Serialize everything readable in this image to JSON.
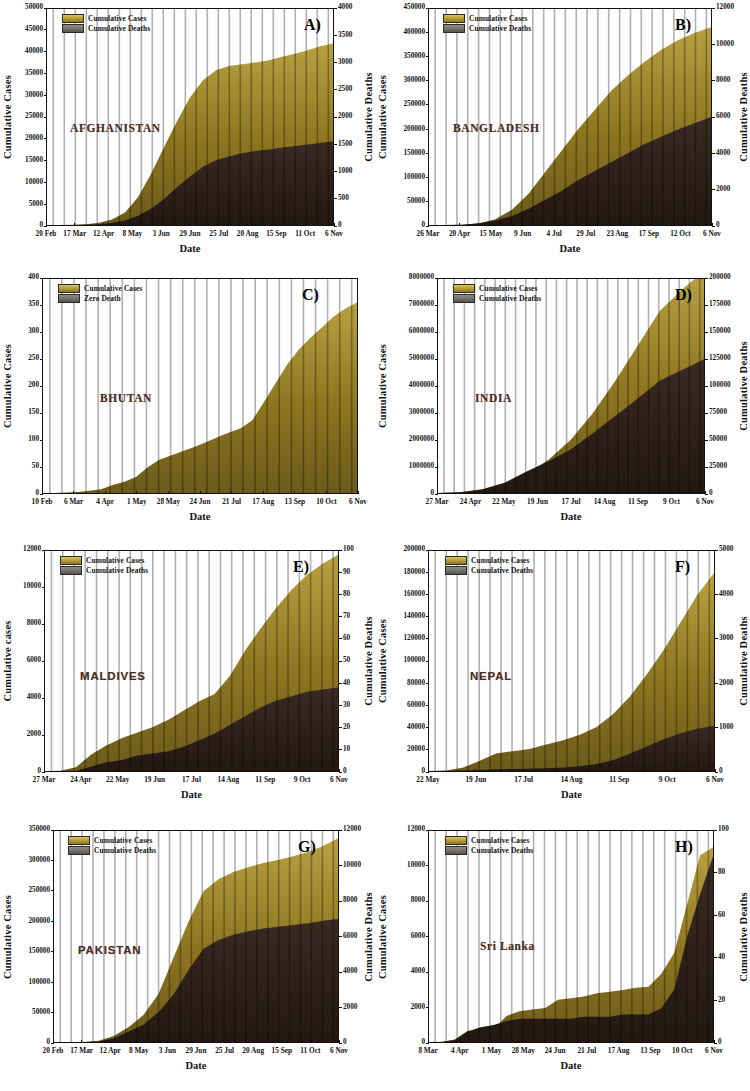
{
  "figure": {
    "xlabel": "Date",
    "legend_cases": "Cumulative Cases",
    "legend_deaths": "Cumulative Deaths",
    "legend_zero_death": "Zero Death",
    "colors": {
      "cases": "#8d7520",
      "cases_light": "#c9b44c",
      "deaths": "#3a2a22",
      "deaths_swatch": "#75726f",
      "axis": "#111111",
      "country_text": "#4a2c23",
      "background": "#ffffff"
    }
  },
  "chart_data": [
    {
      "panel": "A)",
      "type": "area",
      "country": "AFGHANISTAN",
      "title": "AFGHANISTAN",
      "xlabel": "Date",
      "ylabel": "Cumulative Cases",
      "y2label": "Cumulative Deaths",
      "ylim": [
        0,
        50000
      ],
      "y2lim": [
        0,
        4000
      ],
      "yticks": [
        "0",
        "5000",
        "10000",
        "15000",
        "20000",
        "25000",
        "30000",
        "35000",
        "40000",
        "45000",
        "50000"
      ],
      "y2ticks": [
        "0",
        "500",
        "1000",
        "1500",
        "2000",
        "2500",
        "3000",
        "3500",
        "4000"
      ],
      "xticks": [
        "20 Feb",
        "17 Mar",
        "12 Apr",
        "8 May",
        "3 Jun",
        "29 Jun",
        "25 Jul",
        "20 Aug",
        "15 Sep",
        "11 Oct",
        "6 Nov"
      ],
      "legend": [
        "Cumulative Cases",
        "Cumulative Deaths"
      ],
      "series": [
        {
          "name": "Cumulative Cases",
          "values": [
            0,
            5,
            40,
            170,
            500,
            1280,
            2900,
            6400,
            11800,
            18000,
            24000,
            29500,
            33500,
            35800,
            36800,
            37200,
            37600,
            38100,
            38900,
            39600,
            40400,
            41400,
            42000
          ]
        },
        {
          "name": "Cumulative Deaths",
          "values": [
            0,
            0,
            1,
            4,
            15,
            40,
            85,
            170,
            300,
            480,
            700,
            900,
            1080,
            1200,
            1270,
            1330,
            1370,
            1400,
            1430,
            1460,
            1490,
            1520,
            1550
          ]
        }
      ],
      "x": [
        "20 Feb",
        "27 Feb",
        "5 Mar",
        "17 Mar",
        "29 Mar",
        "8 Apr",
        "20 Apr",
        "1 May",
        "8 May",
        "20 May",
        "3 Jun",
        "16 Jun",
        "29 Jun",
        "10 Jul",
        "25 Jul",
        "5 Aug",
        "20 Aug",
        "1 Sep",
        "15 Sep",
        "28 Sep",
        "11 Oct",
        "24 Oct",
        "6 Nov"
      ]
    },
    {
      "panel": "B)",
      "type": "area",
      "country": "BANGLADESH",
      "title": "BANGLADESH",
      "xlabel": "Date",
      "ylabel": "Cumulative Cases",
      "y2label": "Cumulative Deaths",
      "ylim": [
        0,
        450000
      ],
      "y2lim": [
        0,
        12000
      ],
      "yticks": [
        "0",
        "50000",
        "100000",
        "150000",
        "200000",
        "250000",
        "300000",
        "350000",
        "400000",
        "450000"
      ],
      "y2ticks": [
        "0",
        "2000",
        "4000",
        "6000",
        "8000",
        "10000",
        "12000"
      ],
      "xticks": [
        "26 Mar",
        "20 Apr",
        "15 May",
        "9 Jun",
        "4 Jul",
        "29 Jul",
        "23 Aug",
        "17 Sep",
        "12 Oct",
        "6 Nov"
      ],
      "legend": [
        "Cumulative Cases",
        "Cumulative Deaths"
      ],
      "series": [
        {
          "name": "Cumulative Cases",
          "values": [
            0,
            50,
            500,
            3000,
            12000,
            32000,
            65000,
            110000,
            155000,
            200000,
            240000,
            280000,
            312000,
            340000,
            365000,
            385000,
            400000,
            412000
          ]
        },
        {
          "name": "Cumulative Deaths",
          "values": [
            0,
            2,
            20,
            100,
            250,
            500,
            900,
            1400,
            1900,
            2500,
            3000,
            3500,
            4000,
            4500,
            4900,
            5300,
            5650,
            6000
          ]
        }
      ],
      "x": [
        "26 Mar",
        "8 Apr",
        "20 Apr",
        "2 May",
        "15 May",
        "26 May",
        "9 Jun",
        "21 Jun",
        "4 Jul",
        "16 Jul",
        "29 Jul",
        "10 Aug",
        "23 Aug",
        "4 Sep",
        "17 Sep",
        "29 Sep",
        "12 Oct",
        "6 Nov"
      ]
    },
    {
      "panel": "C)",
      "type": "area",
      "country": "BHUTAN",
      "title": "BHUTAN",
      "xlabel": "Date",
      "ylabel": "Cumulative Cases",
      "y2label": null,
      "ylim": [
        0,
        400
      ],
      "yticks": [
        "0",
        "50",
        "100",
        "150",
        "200",
        "250",
        "300",
        "350",
        "400"
      ],
      "xticks": [
        "10 Feb",
        "6 Mar",
        "4 Apr",
        "1 May",
        "28 May",
        "24 Jun",
        "21 Jul",
        "17 Aug",
        "13 Sep",
        "10 Oct",
        "6 Nov"
      ],
      "legend": [
        "Cumulative Cases",
        "Zero Death"
      ],
      "series": [
        {
          "name": "Cumulative Cases",
          "values": [
            0,
            0,
            1,
            2,
            4,
            7,
            15,
            21,
            30,
            48,
            62,
            70,
            78,
            86,
            95,
            104,
            113,
            121,
            136,
            170,
            205,
            240,
            268,
            290,
            310,
            330,
            345,
            356
          ]
        }
      ],
      "x": [
        "10 Feb",
        "25 Feb",
        "6 Mar",
        "20 Mar",
        "4 Apr",
        "18 Apr",
        "1 May",
        "14 May",
        "28 May",
        "10 Jun",
        "24 Jun",
        "7 Jul",
        "21 Jul",
        "3 Aug",
        "17 Aug",
        "31 Aug",
        "13 Sep",
        "26 Sep",
        "10 Oct",
        "20 Oct",
        "6 Nov"
      ]
    },
    {
      "panel": "D)",
      "type": "area",
      "country": "INDIA",
      "title": "INDIA",
      "xlabel": "Date",
      "ylabel": "Cumulative Cases",
      "y2label": "Cumulative Deaths",
      "ylim": [
        0,
        8000000
      ],
      "y2lim": [
        0,
        200000
      ],
      "yticks": [
        "0",
        "1000000",
        "2000000",
        "3000000",
        "4000000",
        "5000000",
        "6000000",
        "7000000",
        "8000000"
      ],
      "y2ticks": [
        "0",
        "25000",
        "50000",
        "75000",
        "100000",
        "125000",
        "150000",
        "175000",
        "200000"
      ],
      "xticks": [
        "27 Mar",
        "24 Apr",
        "22 May",
        "19 Jun",
        "17 Jul",
        "14 Aug",
        "11 Sep",
        "9 Oct",
        "6 Nov"
      ],
      "legend": [
        "Cumulative Cases",
        "Cumulative Deaths"
      ],
      "series": [
        {
          "name": "Cumulative Cases",
          "values": [
            0,
            25000,
            120000,
            330000,
            700000,
            1250000,
            2000000,
            3000000,
            4200000,
            5500000,
            6800000,
            7600000,
            8300000
          ]
        },
        {
          "name": "Cumulative Deaths",
          "values": [
            0,
            800,
            3600,
            9500,
            20000,
            30000,
            41000,
            56000,
            72000,
            88000,
            105000,
            115000,
            125000
          ]
        }
      ],
      "x": [
        "27 Mar",
        "24 Apr",
        "22 May",
        "19 Jun",
        "10 Jul",
        "17 Jul",
        "5 Aug",
        "14 Aug",
        "1 Sep",
        "11 Sep",
        "25 Sep",
        "9 Oct",
        "6 Nov"
      ]
    },
    {
      "panel": "E)",
      "type": "area",
      "country": "MALDIVES",
      "title": "MALDIVES",
      "xlabel": "Date",
      "ylabel": "Cumulative cases",
      "y2label": "Cumulative Deaths",
      "ylim": [
        0,
        12000
      ],
      "y2lim": [
        0,
        100
      ],
      "yticks": [
        "0",
        "2000",
        "4000",
        "6000",
        "8000",
        "10000",
        "12000"
      ],
      "y2ticks": [
        "0",
        "10",
        "20",
        "30",
        "40",
        "50",
        "60",
        "70",
        "80",
        "90",
        "100"
      ],
      "xticks": [
        "27 Mar",
        "24 Apr",
        "22 May",
        "19 Jun",
        "17 Jul",
        "14 Aug",
        "11 Sep",
        "9 Oct",
        "6 Nov"
      ],
      "legend": [
        "Cumulative Cases",
        "Cumulative Deaths"
      ],
      "series": [
        {
          "name": "Cumulative Cases",
          "values": [
            0,
            20,
            200,
            900,
            1400,
            1800,
            2100,
            2400,
            2800,
            3300,
            3800,
            4200,
            5200,
            6600,
            7800,
            8900,
            9900,
            10700,
            11300,
            11800
          ]
        },
        {
          "name": "Cumulative Deaths",
          "values": [
            0,
            0,
            0,
            2,
            4,
            5,
            7,
            8,
            9,
            11,
            14,
            17,
            21,
            25,
            29,
            32,
            34,
            36,
            37,
            38
          ]
        }
      ],
      "x": [
        "27 Mar",
        "10 Apr",
        "24 Apr",
        "8 May",
        "22 May",
        "5 Jun",
        "19 Jun",
        "3 Jul",
        "17 Jul",
        "31 Jul",
        "14 Aug",
        "28 Aug",
        "11 Sep",
        "25 Sep",
        "9 Oct",
        "20 Oct",
        "6 Nov"
      ]
    },
    {
      "panel": "F)",
      "type": "area",
      "country": "NEPAL",
      "title": "NEPAL",
      "xlabel": "Date",
      "ylabel": "Cumulative Cases",
      "y2label": "Cumulative Deaths",
      "ylim": [
        0,
        200000
      ],
      "y2lim": [
        0,
        5000
      ],
      "yticks": [
        "0",
        "20000",
        "40000",
        "60000",
        "80000",
        "100000",
        "120000",
        "140000",
        "160000",
        "180000",
        "200000"
      ],
      "y2ticks": [
        "0",
        "1000",
        "2000",
        "3000",
        "4000",
        "5000"
      ],
      "xticks": [
        "22 May",
        "19 Jun",
        "17 Jul",
        "14 Aug",
        "11 Sep",
        "9 Oct",
        "6 Nov"
      ],
      "legend": [
        "Cumulative Cases",
        "Cumulative Deaths"
      ],
      "series": [
        {
          "name": "Cumulative Cases",
          "values": [
            0,
            500,
            3000,
            9000,
            16000,
            18000,
            20000,
            24000,
            28000,
            33000,
            40000,
            52000,
            68000,
            88000,
            110000,
            135000,
            160000,
            180000
          ]
        },
        {
          "name": "Cumulative Deaths",
          "values": [
            0,
            2,
            12,
            25,
            40,
            45,
            50,
            60,
            80,
            110,
            160,
            250,
            400,
            560,
            720,
            860,
            960,
            1030
          ]
        }
      ],
      "x": [
        "22 May",
        "5 Jun",
        "19 Jun",
        "3 Jul",
        "17 Jul",
        "31 Jul",
        "14 Aug",
        "28 Aug",
        "11 Sep",
        "25 Sep",
        "9 Oct",
        "23 Oct",
        "6 Nov"
      ]
    },
    {
      "panel": "G)",
      "type": "area",
      "country": "PAKISTAN",
      "title": "PAKISTAN",
      "xlabel": "Date",
      "ylabel": "Cumulative Cases",
      "y2label": "Cumulative Deaths",
      "ylim": [
        0,
        350000
      ],
      "y2lim": [
        0,
        12000
      ],
      "yticks": [
        "0",
        "50000",
        "100000",
        "150000",
        "200000",
        "250000",
        "300000",
        "350000"
      ],
      "y2ticks": [
        "0",
        "2000",
        "4000",
        "6000",
        "8000",
        "10000",
        "12000"
      ],
      "xticks": [
        "20 Feb",
        "17 Mar",
        "12 Apr",
        "8 May",
        "3 Jun",
        "29 Jun",
        "25 Jul",
        "20 Aug",
        "15 Sep",
        "11 Oct",
        "6 Nov"
      ],
      "legend": [
        "Cumulative Cases",
        "Cumulative Deaths"
      ],
      "series": [
        {
          "name": "Cumulative Cases",
          "values": [
            0,
            10,
            100,
            2000,
            10000,
            25000,
            45000,
            80000,
            140000,
            200000,
            250000,
            270000,
            282000,
            290000,
            297000,
            302000,
            308000,
            315000,
            325000,
            338000
          ]
        },
        {
          "name": "Cumulative Deaths",
          "values": [
            0,
            0,
            2,
            30,
            220,
            600,
            1000,
            1700,
            2700,
            4100,
            5300,
            5800,
            6100,
            6300,
            6450,
            6550,
            6650,
            6750,
            6900,
            7000
          ]
        }
      ],
      "x": [
        "20 Feb",
        "5 Mar",
        "17 Mar",
        "1 Apr",
        "12 Apr",
        "25 Apr",
        "8 May",
        "20 May",
        "3 Jun",
        "16 Jun",
        "29 Jun",
        "10 Jul",
        "25 Jul",
        "5 Aug",
        "20 Aug",
        "1 Sep",
        "15 Sep",
        "28 Sep",
        "11 Oct",
        "6 Nov"
      ]
    },
    {
      "panel": "H)",
      "type": "area",
      "country": "Sri Lanka",
      "title": "Sri Lanka",
      "xlabel": "Date",
      "ylabel": "Cumulative Cases",
      "y2label": "Cumulative Deaths",
      "ylim": [
        0,
        13000
      ],
      "y2lim": [
        0,
        100
      ],
      "yticks": [
        "0",
        "2000",
        "4000",
        "6000",
        "8000",
        "10000",
        "12000"
      ],
      "y2ticks": [
        "0",
        "20",
        "40",
        "60",
        "80",
        "100"
      ],
      "xticks": [
        "8 Mar",
        "4 Apr",
        "1 May",
        "28 May",
        "24 Jun",
        "21 Jul",
        "17 Aug",
        "13 Sep",
        "10 Oct",
        "6 Nov"
      ],
      "legend": [
        "Cumulative Cases",
        "Cumulative Deaths"
      ],
      "series": [
        {
          "name": "Cumulative Cases",
          "values": [
            0,
            20,
            150,
            700,
            740,
            780,
            1600,
            1900,
            2000,
            2100,
            2600,
            2700,
            2800,
            3000,
            3100,
            3200,
            3350,
            3400,
            4200,
            5500,
            8500,
            11500,
            12000
          ]
        },
        {
          "name": "Cumulative Deaths",
          "values": [
            0,
            0,
            1,
            5,
            7,
            8,
            10,
            11,
            11,
            11,
            11,
            11,
            12,
            12,
            12,
            13,
            13,
            13,
            16,
            25,
            50,
            70,
            88
          ]
        }
      ],
      "x": [
        "8 Mar",
        "20 Mar",
        "4 Apr",
        "18 Apr",
        "1 May",
        "14 May",
        "28 May",
        "10 Jun",
        "24 Jun",
        "7 Jul",
        "21 Jul",
        "3 Aug",
        "17 Aug",
        "31 Aug",
        "13 Sep",
        "26 Sep",
        "10 Oct",
        "20 Oct",
        "28 Oct",
        "6 Nov"
      ]
    }
  ]
}
